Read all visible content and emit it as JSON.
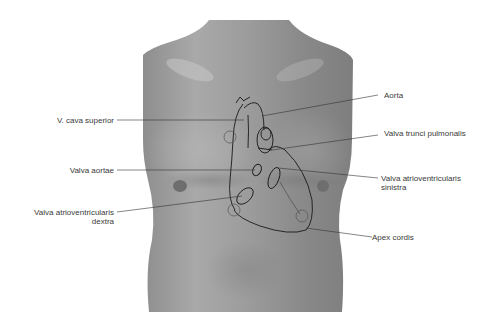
{
  "figure": {
    "labels_left": [
      {
        "id": "v-cava-superior",
        "text": "V. cava superior"
      },
      {
        "id": "valva-aortae",
        "text": "Valva aortae"
      },
      {
        "id": "valva-av-dextra",
        "line1": "Valva atrioventricularis",
        "line2": "dextra"
      }
    ],
    "labels_right": [
      {
        "id": "aorta",
        "text": "Aorta"
      },
      {
        "id": "valva-trunci-pulmonalis",
        "text": "Valva trunci pulmonalis"
      },
      {
        "id": "valva-av-sinistra",
        "line1": "Valva atrioventricularis",
        "line2": "sinistra"
      },
      {
        "id": "apex-cordis",
        "text": "Apex cordis"
      }
    ],
    "colors": {
      "skin_light": "#bdbdbd",
      "skin_mid": "#9a9a9a",
      "skin_dark": "#7a7a7a",
      "outline": "#1a1a1a",
      "leader": "#333333",
      "label_text": "#3a3a3a"
    }
  }
}
